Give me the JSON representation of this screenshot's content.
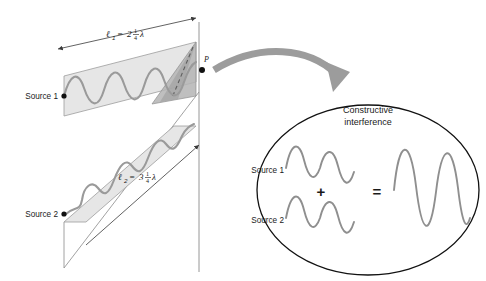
{
  "figure": {
    "left_panel": {
      "source1_label": "Source 1",
      "source2_label": "Source 2",
      "point_label": "P",
      "path1": {
        "symbol": "ℓ",
        "subscript": "1",
        "equals": "=",
        "whole": "2",
        "numerator": "1",
        "denominator": "4",
        "unit": "λ",
        "plain": "ℓ₁ = 2 1/4 λ",
        "value_wavelengths": 2.25
      },
      "path2": {
        "symbol": "ℓ",
        "subscript": "2",
        "equals": "=",
        "whole": "3",
        "numerator": "1",
        "denominator": "4",
        "unit": "λ",
        "plain": "ℓ₂ = 3 1/4 λ",
        "value_wavelengths": 3.25
      }
    },
    "callout": {
      "title_line1": "Constructive",
      "title_line2": "interference",
      "source1_label": "Source 1",
      "source2_label": "Source 2",
      "plus_symbol": "+",
      "equals_symbol": "=",
      "wave1_cycles": 2,
      "wave2_cycles": 2,
      "result_cycles": 2,
      "result_amplitude_ratio": 2,
      "phase_difference_deg": 0
    },
    "colors": {
      "wave_stroke": "#9a9a9a",
      "band_fill": "#e2e2e2",
      "band_fill_dark": "#c6c6c6",
      "triangle_dark": "#a8a8a8",
      "outline": "#8d8d8d",
      "arrow_gray": "#9c9c9c",
      "text": "#1a1a1a",
      "callout_outline": "#111111",
      "callout_wave": "#8f8f8f",
      "axis_line": "#7a7a7a"
    }
  }
}
